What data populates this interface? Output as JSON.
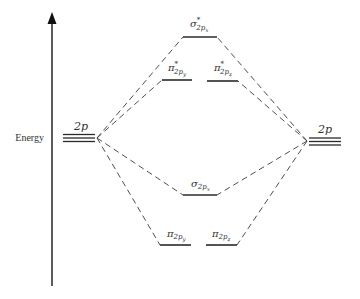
{
  "diagram": {
    "axis": {
      "label": "Energy",
      "direction": "up"
    },
    "atomic_orbitals": {
      "left": {
        "label": "2p",
        "count": 3
      },
      "right": {
        "label": "2p",
        "count": 3
      }
    },
    "molecular_orbitals": [
      {
        "id": "sigma_star_2px",
        "symbol": "σ",
        "star": "*",
        "subscript": "2p",
        "sub_sub": "x",
        "type": "antibonding"
      },
      {
        "id": "pi_star_2py",
        "symbol": "π",
        "star": "*",
        "subscript": "2p",
        "sub_sub": "y",
        "type": "antibonding"
      },
      {
        "id": "pi_star_2pz",
        "symbol": "π",
        "star": "*",
        "subscript": "2p",
        "sub_sub": "z",
        "type": "antibonding"
      },
      {
        "id": "sigma_2px",
        "symbol": "σ",
        "star": "",
        "subscript": "2p",
        "sub_sub": "x",
        "type": "bonding"
      },
      {
        "id": "pi_2py",
        "symbol": "π",
        "star": "",
        "subscript": "2p",
        "sub_sub": "y",
        "type": "bonding"
      },
      {
        "id": "pi_2pz",
        "symbol": "π",
        "star": "",
        "subscript": "2p",
        "sub_sub": "z",
        "type": "bonding"
      }
    ]
  }
}
